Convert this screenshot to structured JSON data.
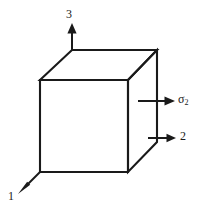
{
  "figure": {
    "background_color": "#ffffff",
    "line_color": "#1a1a1a",
    "width": 206,
    "height": 212
  },
  "shape": {
    "name": "cube",
    "projection": "isometric",
    "front_face": {
      "x": 40,
      "y": 80,
      "width": 88,
      "height": 92
    },
    "depth_offset": {
      "dx": 30,
      "dy": -30
    }
  },
  "axes": [
    {
      "id": "axis-3",
      "label": "3",
      "sigma_label": "",
      "direction": "up",
      "origin": {
        "x": 72,
        "y": 50
      },
      "tip": {
        "x": 72,
        "y": 26
      }
    },
    {
      "id": "axis-sigma-2",
      "label": "σ",
      "subscript": "2",
      "direction": "right",
      "origin": {
        "x": 140,
        "y": 101
      },
      "tip": {
        "x": 173,
        "y": 101
      }
    },
    {
      "id": "axis-2",
      "label": "2",
      "sigma_label": "",
      "direction": "right",
      "origin": {
        "x": 148,
        "y": 138
      },
      "tip": {
        "x": 174,
        "y": 138
      }
    },
    {
      "id": "axis-1",
      "label": "1",
      "sigma_label": "",
      "direction": "down-left",
      "origin": {
        "x": 40,
        "y": 172
      },
      "tip": {
        "x": 19,
        "y": 192
      }
    }
  ],
  "labels": {
    "axis_3": "3",
    "axis_1": "1",
    "axis_2": "2",
    "sigma_symbol": "σ",
    "sigma_subscript": "2"
  }
}
